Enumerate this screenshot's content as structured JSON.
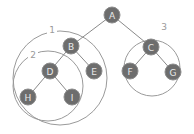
{
  "diagram": {
    "type": "binary-tree-with-subtree-groupings",
    "nodes": [
      {
        "id": "A",
        "label": "A",
        "x": 112,
        "y": 15
      },
      {
        "id": "B",
        "label": "B",
        "x": 71,
        "y": 46
      },
      {
        "id": "C",
        "label": "C",
        "x": 151,
        "y": 47
      },
      {
        "id": "D",
        "label": "D",
        "x": 50,
        "y": 71
      },
      {
        "id": "E",
        "label": "E",
        "x": 94,
        "y": 71
      },
      {
        "id": "F",
        "label": "F",
        "x": 130,
        "y": 71
      },
      {
        "id": "G",
        "label": "G",
        "x": 173,
        "y": 72
      },
      {
        "id": "H",
        "label": "H",
        "x": 28,
        "y": 97
      },
      {
        "id": "I",
        "label": "I",
        "x": 72,
        "y": 97
      }
    ],
    "edges": [
      [
        "A",
        "B"
      ],
      [
        "A",
        "C"
      ],
      [
        "B",
        "D"
      ],
      [
        "B",
        "E"
      ],
      [
        "C",
        "F"
      ],
      [
        "C",
        "G"
      ],
      [
        "D",
        "H"
      ],
      [
        "D",
        "I"
      ]
    ],
    "groups": [
      {
        "label": "1",
        "cx": 60,
        "cy": 78,
        "r": 47,
        "label_x": 52,
        "label_y": 30,
        "contains": [
          "B",
          "D",
          "E",
          "H",
          "I"
        ]
      },
      {
        "label": "2",
        "cx": 48,
        "cy": 86,
        "r": 35,
        "label_x": 33,
        "label_y": 55,
        "contains": [
          "D",
          "H",
          "I"
        ]
      },
      {
        "label": "3",
        "cx": 152,
        "cy": 68,
        "r": 28,
        "label_x": 164,
        "label_y": 27,
        "contains": [
          "C",
          "F",
          "G"
        ]
      }
    ],
    "colors": {
      "node_fill": "#6d6d6d",
      "node_text": "#e8e8e8",
      "edge": "#8a8a8a",
      "ring": "#9a9a9a",
      "background": "#ffffff"
    }
  }
}
